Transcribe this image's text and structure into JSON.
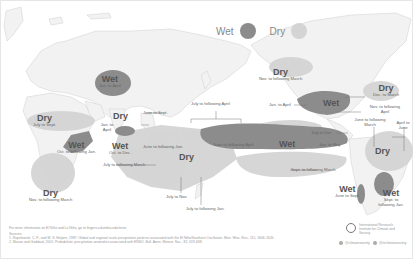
{
  "legend": {
    "wet_label": "Wet",
    "dry_label": "Dry",
    "wet_color": "#8c8c8c",
    "dry_color": "#d4d4d4"
  },
  "regions": [
    {
      "id": "india",
      "type": "Wet",
      "period": "Jan. to April"
    },
    {
      "id": "west-africa",
      "type": "Dry",
      "period": "July to Sept."
    },
    {
      "id": "se-asia-north",
      "type": "Dry",
      "period": "June to Sept."
    },
    {
      "id": "maritime-jan-april",
      "type": "",
      "period": "Jan. to April"
    },
    {
      "id": "east-africa",
      "type": "Wet",
      "period": "Oct. to following Jan."
    },
    {
      "id": "sri-lanka",
      "type": "Wet",
      "period": "Oct. to Dec."
    },
    {
      "id": "southern-africa",
      "type": "Dry",
      "period": "Nov. to following March"
    },
    {
      "id": "indonesia",
      "type": "Dry",
      "period": "June to following Jan."
    },
    {
      "id": "indian-ocean",
      "type": "",
      "period": "July to following March"
    },
    {
      "id": "australia",
      "type": "",
      "period": "July to Nov."
    },
    {
      "id": "australia-east",
      "type": "",
      "period": "July to following Jan."
    },
    {
      "id": "central-pacific-bracket",
      "type": "",
      "period": "July to following April"
    },
    {
      "id": "central-pacific",
      "type": "Wet",
      "period": "June to following April"
    },
    {
      "id": "east-pacific",
      "type": "",
      "period": "Jan. to May"
    },
    {
      "id": "alaska",
      "type": "Dry",
      "period": "Nov. to following March"
    },
    {
      "id": "us-south",
      "type": "Wet",
      "period": "Jan. to April"
    },
    {
      "id": "great-lakes",
      "type": "Dry",
      "period": "Dec. to March"
    },
    {
      "id": "us-southeast",
      "type": "",
      "period": "Nov. to following April"
    },
    {
      "id": "central-america",
      "type": "",
      "period": "June to following March"
    },
    {
      "id": "caribbean",
      "type": "",
      "period": "April to June"
    },
    {
      "id": "hawaii",
      "type": "",
      "period": "July to Dec."
    },
    {
      "id": "northern-south-america",
      "type": "Dry",
      "period": ""
    },
    {
      "id": "south-pacific",
      "type": "",
      "period": "Sept. to following March"
    },
    {
      "id": "chile",
      "type": "Wet",
      "period": "June to Sept."
    },
    {
      "id": "southeast-south-america",
      "type": "Wet",
      "period": "Sept. to following Jan."
    }
  ],
  "footer": {
    "note": "For more information on El Niño and La Niña, go to fingers.columbia.edu/enso",
    "sources_label": "Sources:",
    "source_1": "1. Ropelewski, C. F., and M. S. Halpert, 1987: Global and regional scale precipitation patterns associated with the El Niño/Southern Oscillation. Mon. Wea. Rev., 115, 1606-1626.",
    "source_2": "2. Mason and Goddard, 2001: Probabilistic precipitation anomalies associated with ENSO. Bull. Amer. Meteor. Soc., 82, 619-638.",
    "org_name": "International Research Institute for Climate and Society",
    "social_1": "@climatesociety",
    "social_2": "@iriclimatesociety"
  }
}
